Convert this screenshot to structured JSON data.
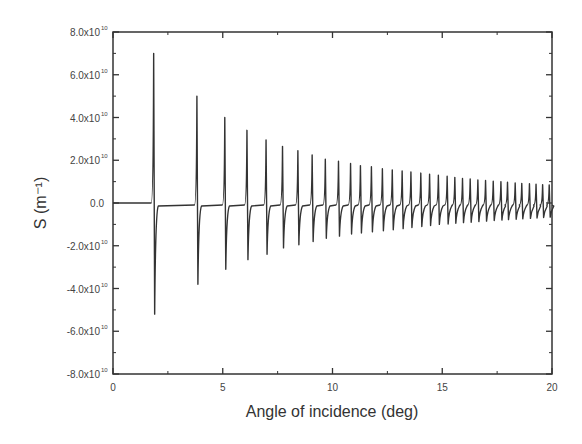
{
  "chart_data": {
    "type": "line",
    "title": "",
    "xlabel": "Angle of incidence (deg)",
    "ylabel": "S (m⁻¹)",
    "xlim": [
      0,
      20
    ],
    "ylim": [
      -80000000000.0,
      80000000000.0
    ],
    "grid": false,
    "legend": null,
    "x_ticks": [
      0,
      5,
      10,
      15,
      20
    ],
    "x_tick_labels": [
      "0",
      "5",
      "10",
      "15",
      "20"
    ],
    "y_ticks": [
      80000000000.0,
      60000000000.0,
      40000000000.0,
      20000000000.0,
      0,
      -20000000000.0,
      -40000000000.0,
      -60000000000.0,
      -80000000000.0
    ],
    "y_tick_labels": [
      {
        "mant": "8.0x10",
        "exp": "10"
      },
      {
        "mant": "6.0x10",
        "exp": "10"
      },
      {
        "mant": "4.0x10",
        "exp": "10"
      },
      {
        "mant": "2.0x10",
        "exp": "10"
      },
      {
        "mant": "0.0",
        "exp": ""
      },
      {
        "mant": "-2.0x10",
        "exp": "10"
      },
      {
        "mant": "-4.0x10",
        "exp": "10"
      },
      {
        "mant": "-6.0x10",
        "exp": "10"
      },
      {
        "mant": "-8.0x10",
        "exp": "10"
      }
    ],
    "series": [
      {
        "name": "S",
        "color": "#333333",
        "description": "Resonant spikes: sharp positive peak followed immediately by a negative trough; amplitude decays with angle",
        "peaks": [
          {
            "angle": 1.88,
            "max": 70000000000.0,
            "min": -52000000000.0
          },
          {
            "angle": 3.85,
            "max": 50000000000.0,
            "min": -38000000000.0
          },
          {
            "angle": 5.12,
            "max": 40000000000.0,
            "min": -31000000000.0
          },
          {
            "angle": 6.13,
            "max": 34000000000.0,
            "min": -26500000000.0
          },
          {
            "angle": 7.0,
            "max": 29500000000.0,
            "min": -24000000000.0
          },
          {
            "angle": 7.75,
            "max": 26500000000.0,
            "min": -21000000000.0
          },
          {
            "angle": 8.45,
            "max": 24500000000.0,
            "min": -19500000000.0
          },
          {
            "angle": 9.1,
            "max": 22500000000.0,
            "min": -18000000000.0
          },
          {
            "angle": 9.7,
            "max": 20500000000.0,
            "min": -16500000000.0
          },
          {
            "angle": 10.3,
            "max": 19500000000.0,
            "min": -15500000000.0
          },
          {
            "angle": 10.85,
            "max": 18500000000.0,
            "min": -14500000000.0
          },
          {
            "angle": 11.3,
            "max": 17500000000.0,
            "min": -14000000000.0
          },
          {
            "angle": 11.8,
            "max": 17000000000.0,
            "min": -13500000000.0
          },
          {
            "angle": 12.3,
            "max": 16000000000.0,
            "min": -13000000000.0
          },
          {
            "angle": 12.75,
            "max": 15500000000.0,
            "min": -12500000000.0
          },
          {
            "angle": 13.2,
            "max": 15000000000.0,
            "min": -12000000000.0
          },
          {
            "angle": 13.6,
            "max": 14500000000.0,
            "min": -11500000000.0
          },
          {
            "angle": 14.05,
            "max": 14000000000.0,
            "min": -11000000000.0
          },
          {
            "angle": 14.45,
            "max": 13500000000.0,
            "min": -10500000000.0
          },
          {
            "angle": 14.85,
            "max": 13000000000.0,
            "min": -10000000000.0
          },
          {
            "angle": 15.25,
            "max": 12500000000.0,
            "min": -9800000000.0
          },
          {
            "angle": 15.6,
            "max": 12000000000.0,
            "min": -9500000000.0
          },
          {
            "angle": 15.95,
            "max": 11500000000.0,
            "min": -9200000000.0
          },
          {
            "angle": 16.3,
            "max": 11200000000.0,
            "min": -9000000000.0
          },
          {
            "angle": 16.65,
            "max": 10800000000.0,
            "min": -8700000000.0
          },
          {
            "angle": 17.0,
            "max": 10500000000.0,
            "min": -8500000000.0
          },
          {
            "angle": 17.35,
            "max": 10200000000.0,
            "min": -8200000000.0
          },
          {
            "angle": 17.7,
            "max": 10000000000.0,
            "min": -8000000000.0
          },
          {
            "angle": 18.0,
            "max": 9700000000.0,
            "min": -7800000000.0
          },
          {
            "angle": 18.35,
            "max": 9400000000.0,
            "min": -7600000000.0
          },
          {
            "angle": 18.65,
            "max": 9200000000.0,
            "min": -7400000000.0
          },
          {
            "angle": 19.0,
            "max": 9000000000.0,
            "min": -7200000000.0
          },
          {
            "angle": 19.3,
            "max": 8800000000.0,
            "min": -7000000000.0
          },
          {
            "angle": 19.6,
            "max": 8600000000.0,
            "min": -6800000000.0
          },
          {
            "angle": 19.9,
            "max": 8500000000.0,
            "min": -6600000000.0
          }
        ]
      }
    ]
  }
}
